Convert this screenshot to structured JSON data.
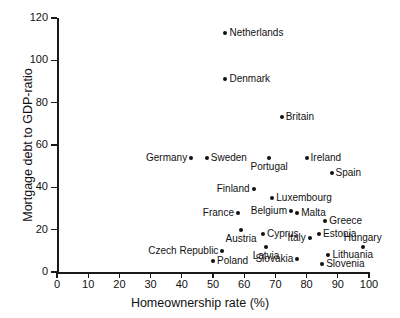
{
  "chart_data": {
    "type": "scatter",
    "title": "",
    "xlabel": "Homeownership rate (%)",
    "ylabel": "Mortgage debt to GDP-ratio",
    "xlim": [
      0,
      100
    ],
    "ylim": [
      0,
      120
    ],
    "xticks": [
      0,
      10,
      20,
      30,
      40,
      50,
      60,
      70,
      80,
      90,
      100
    ],
    "yticks": [
      0,
      20,
      40,
      60,
      80,
      100,
      120
    ],
    "grid": false,
    "legend": "none",
    "marker_color": "#111111",
    "points": [
      {
        "label": "Netherlands",
        "x": 54,
        "y": 113,
        "anchor": "right"
      },
      {
        "label": "Denmark",
        "x": 54,
        "y": 91,
        "anchor": "right"
      },
      {
        "label": "Britain",
        "x": 72,
        "y": 73,
        "anchor": "right"
      },
      {
        "label": "Germany",
        "x": 43,
        "y": 54,
        "anchor": "left"
      },
      {
        "label": "Sweden",
        "x": 48,
        "y": 54,
        "anchor": "right"
      },
      {
        "label": "Portugal",
        "x": 68,
        "y": 54,
        "anchor": "below"
      },
      {
        "label": "Ireland",
        "x": 80,
        "y": 54,
        "anchor": "right"
      },
      {
        "label": "Spain",
        "x": 88,
        "y": 47,
        "anchor": "right"
      },
      {
        "label": "Finland",
        "x": 63,
        "y": 39,
        "anchor": "left"
      },
      {
        "label": "Luxembourg",
        "x": 69,
        "y": 35,
        "anchor": "right"
      },
      {
        "label": "Belgium",
        "x": 75,
        "y": 29,
        "anchor": "left"
      },
      {
        "label": "Malta",
        "x": 77,
        "y": 28,
        "anchor": "right"
      },
      {
        "label": "France",
        "x": 58,
        "y": 28,
        "anchor": "left"
      },
      {
        "label": "Austria",
        "x": 59,
        "y": 20,
        "anchor": "below"
      },
      {
        "label": "Cyprus",
        "x": 66,
        "y": 18,
        "anchor": "right"
      },
      {
        "label": "Greece",
        "x": 86,
        "y": 24,
        "anchor": "right"
      },
      {
        "label": "Estonia",
        "x": 84,
        "y": 18,
        "anchor": "right"
      },
      {
        "label": "Italy",
        "x": 81,
        "y": 16,
        "anchor": "left"
      },
      {
        "label": "Hungary",
        "x": 98,
        "y": 12,
        "anchor": "above"
      },
      {
        "label": "Latvia",
        "x": 67,
        "y": 12,
        "anchor": "below"
      },
      {
        "label": "Czech Republic",
        "x": 53,
        "y": 10,
        "anchor": "left"
      },
      {
        "label": "Poland",
        "x": 50,
        "y": 5,
        "anchor": "right"
      },
      {
        "label": "Slovakia",
        "x": 77,
        "y": 6,
        "anchor": "left"
      },
      {
        "label": "Lithuania",
        "x": 87,
        "y": 8,
        "anchor": "right"
      },
      {
        "label": "Slovenia",
        "x": 85,
        "y": 4,
        "anchor": "right"
      }
    ]
  }
}
